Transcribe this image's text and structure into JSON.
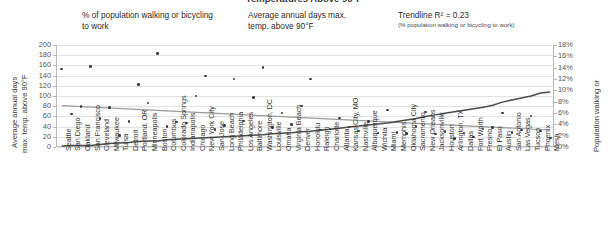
{
  "chart_data": {
    "type": "scatter",
    "title": "Temperatures Above 90°F",
    "legend": [
      {
        "key": "pct",
        "marker": "dot",
        "label": "% of population walking or bicycling to work",
        "sub": ""
      },
      {
        "key": "days",
        "marker": "line",
        "label": "Average annual days max. temp. above 90°F",
        "sub": ""
      },
      {
        "key": "trend",
        "marker": "thin-line",
        "label": "Trendline R² = 0.23",
        "sub": "(% population walking or bicycling to work)"
      }
    ],
    "left_axis": {
      "label": "Average annual days max. temp. above 90°F",
      "label_line1": "Average annual days",
      "label_line2": "max. temp. above 90°F",
      "min": 0,
      "max": 200,
      "step": 20,
      "ticks": [
        "0",
        "20",
        "40",
        "60",
        "80",
        "100",
        "120",
        "140",
        "160",
        "180",
        "200"
      ]
    },
    "right_axis": {
      "label": "Population walking or",
      "min": 0,
      "max": 18,
      "step": 2,
      "ticks": [
        "0%",
        "2%",
        "4%",
        "6%",
        "8%",
        "10%",
        "12%",
        "14%",
        "16%",
        "18%"
      ]
    },
    "categories": [
      "Seattle",
      "San Diego",
      "Oakland",
      "San Francisco",
      "Cleveland",
      "Milwaukee",
      "Tulsa",
      "Detroit",
      "Portland, OR",
      "Minneapolis",
      "Boston",
      "Columbus",
      "Colorado Springs",
      "Indianapolis",
      "Chicago",
      "New York City",
      "San Jose",
      "Long Beach",
      "Philadelphia",
      "Los Angeles",
      "Baltimore",
      "Washington, DC",
      "Louisville",
      "Omaha",
      "Virginia Beach",
      "Denver",
      "Honolulu",
      "Raleigh",
      "Charlotte",
      "Atlanta",
      "Kansas City, MO",
      "Nashville",
      "Albuquerque",
      "Wichita",
      "Miami",
      "Memphis",
      "Oklahoma City",
      "Sacramento",
      "New Orleans",
      "Jacksonville",
      "Houston",
      "Arlington, TX",
      "Dallas",
      "Fort Worth",
      "Fresno",
      "El Paso",
      "Austin",
      "San Antonio",
      "Las Vegas",
      "Tucson",
      "Phoenix",
      "Mesa"
    ],
    "series": [
      {
        "name": "Average annual days max. temp. above 90°F",
        "type": "line",
        "axis": "left",
        "values": [
          2,
          3,
          3,
          3,
          5,
          7,
          8,
          9,
          11,
          12,
          12,
          14,
          15,
          16,
          17,
          18,
          19,
          20,
          21,
          22,
          23,
          24,
          26,
          27,
          28,
          30,
          31,
          33,
          35,
          37,
          39,
          41,
          43,
          45,
          47,
          50,
          53,
          56,
          60,
          63,
          66,
          69,
          72,
          75,
          78,
          82,
          88,
          92,
          96,
          100,
          106,
          108
        ]
      },
      {
        "name": "% of population walking or bicycling to work",
        "type": "scatter",
        "axis": "right",
        "values": [
          13.8,
          5.8,
          7.1,
          14.2,
          5.0,
          7.0,
          2.0,
          4.5,
          11.0,
          7.8,
          16.5,
          3.6,
          4.4,
          4.2,
          9.0,
          12.5,
          3.1,
          3.8,
          12.0,
          4.6,
          8.7,
          14.0,
          3.4,
          6.0,
          4.0,
          7.2,
          12.0,
          3.0,
          3.2,
          5.1,
          3.5,
          2.8,
          4.5,
          2.5,
          6.5,
          2.6,
          2.4,
          3.6,
          6.2,
          2.3,
          2.7,
          1.5,
          2.5,
          1.8,
          3.2,
          3.4,
          6.0,
          2.6,
          3.0,
          5.5,
          2.8,
          1.6
        ]
      },
      {
        "name": "Trendline R² = 0.23",
        "type": "trendline",
        "axis": "right",
        "r_squared": 0.23,
        "start_value": 7.3,
        "end_value": 3.0
      }
    ]
  }
}
